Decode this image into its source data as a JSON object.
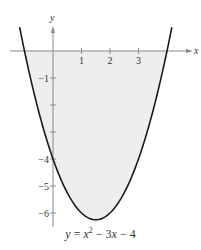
{
  "chart_data": {
    "type": "line",
    "title": "",
    "equation": "y = x² − 3x − 4",
    "caption_parts": [
      "y",
      " = ",
      "x",
      "2",
      " − 3",
      "x",
      " − 4"
    ],
    "xlabel": "x",
    "ylabel": "y",
    "xlim": [
      -1.2,
      4.3
    ],
    "ylim": [
      -6.5,
      0.8
    ],
    "x_ticks": [
      1,
      2,
      3
    ],
    "x_tick_labels": [
      "1",
      "2",
      "3"
    ],
    "y_ticks": [
      -1,
      -2,
      -3,
      -4,
      -5,
      -6
    ],
    "y_tick_labels": [
      "−1",
      "",
      "",
      "−4",
      "−5",
      "−6"
    ],
    "grid": false,
    "shaded_region": "area between curve and x-axis (below x-axis), light gray",
    "series": [
      {
        "name": "y = x^2 - 3x - 4",
        "x": [
          -1.2,
          -1,
          -0.5,
          0,
          0.5,
          1,
          1.5,
          2,
          2.5,
          3,
          3.5,
          4,
          4.2
        ],
        "values": [
          -1.36,
          0,
          2.25,
          -4,
          -5.25,
          -6,
          -6.25,
          -6,
          -5.25,
          -4,
          -2.25,
          0,
          0.04
        ]
      }
    ],
    "key_points": {
      "vertex": [
        1.5,
        -6.25
      ],
      "x_intercepts": [
        -1,
        4
      ],
      "y_intercept": [
        0,
        -4
      ]
    },
    "colors": {
      "curve": "#1a1a1a",
      "fill": "#eeeeee",
      "axis": "#888888",
      "text": "#333333"
    }
  }
}
